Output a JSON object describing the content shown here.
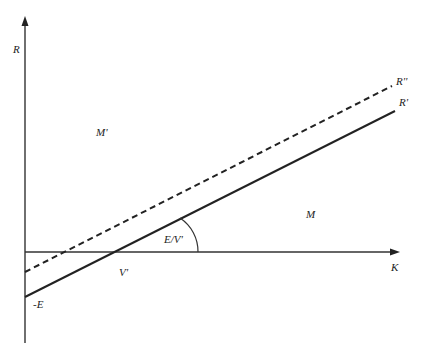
{
  "diagram": {
    "axes": {
      "y_label": "R",
      "x_label": "K"
    },
    "lines": [
      {
        "name": "R'",
        "label": "R'",
        "style": "solid",
        "intercept_label": "-E",
        "x_intercept_label": "V'"
      },
      {
        "name": "R''",
        "label": "R''",
        "style": "dashed"
      }
    ],
    "regions": {
      "upper_left": "M'",
      "lower_right": "M"
    },
    "angle_label": "E/V'",
    "colors": {
      "ink": "#222222",
      "background": "#ffffff"
    }
  }
}
